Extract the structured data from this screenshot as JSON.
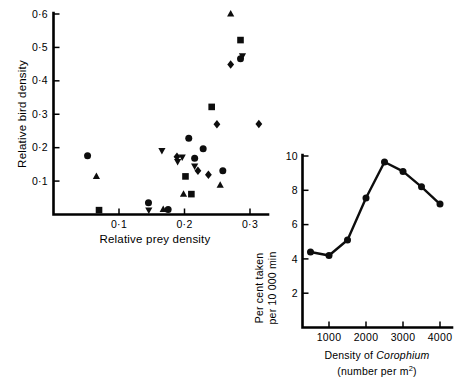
{
  "figure": {
    "name": "relative-bird-density-vs-relative-prey-density"
  },
  "chart_data": [
    {
      "id": "main",
      "type": "scatter",
      "title": "",
      "xlabel": "Relative prey density",
      "ylabel": "Relative bird density",
      "xlim": [
        0.0,
        0.345
      ],
      "ylim": [
        0.0,
        0.615
      ],
      "xticks": [
        0.1,
        0.2,
        0.3
      ],
      "xticklabels": [
        "0·1",
        "0·2",
        "0·3"
      ],
      "yticks": [
        0.1,
        0.2,
        0.3,
        0.4,
        0.5,
        0.6
      ],
      "yticklabels": [
        "0·1",
        "0·2",
        "0·3",
        "0·4",
        "0·5",
        "0·6"
      ],
      "grid": false,
      "legend": "none",
      "series": [
        {
          "name": "circle",
          "marker": "circle",
          "points": [
            [
              0.052,
              0.176
            ],
            [
              0.145,
              0.035
            ],
            [
              0.175,
              0.015
            ],
            [
              0.2065,
              0.228
            ],
            [
              0.2155,
              0.168
            ],
            [
              0.2285,
              0.197
            ],
            [
              0.2585,
              0.131
            ],
            [
              0.2855,
              0.466
            ]
          ]
        },
        {
          "name": "square",
          "marker": "square",
          "points": [
            [
              0.0695,
              0.013
            ],
            [
              0.2015,
              0.114
            ],
            [
              0.2105,
              0.061
            ],
            [
              0.2415,
              0.322
            ],
            [
              0.2855,
              0.522
            ]
          ]
        },
        {
          "name": "triangle-up",
          "marker": "triangle-up",
          "points": [
            [
              0.0655,
              0.114
            ],
            [
              0.1675,
              0.0155
            ],
            [
              0.1985,
              0.061
            ],
            [
              0.2545,
              0.088
            ],
            [
              0.2705,
              0.6
            ]
          ]
        },
        {
          "name": "triangle-down",
          "marker": "triangle-down",
          "points": [
            [
              0.1455,
              0.013
            ],
            [
              0.1655,
              0.191
            ],
            [
              0.1895,
              0.158
            ],
            [
              0.1965,
              0.172
            ],
            [
              0.2155,
              0.145
            ],
            [
              0.2885,
              0.475
            ]
          ]
        },
        {
          "name": "diamond",
          "marker": "diamond",
          "points": [
            [
              0.1885,
              0.173
            ],
            [
              0.2205,
              0.131
            ],
            [
              0.2365,
              0.119
            ],
            [
              0.2495,
              0.27
            ],
            [
              0.2705,
              0.449
            ],
            [
              0.3135,
              0.271
            ]
          ]
        }
      ]
    },
    {
      "id": "inset",
      "type": "line",
      "title": "",
      "xlabel_line1_prefix": "Density of ",
      "xlabel_line1_italic": "Corophium",
      "xlabel_line2": "(number per m",
      "xlabel_line2_sup": "2",
      "xlabel_line2_suffix": ")",
      "ylabel_line1": "Per cent taken",
      "ylabel_line2": "per 10 000 min",
      "xlim": [
        0,
        4450
      ],
      "ylim": [
        0,
        10.6
      ],
      "xticks": [
        1000,
        2000,
        3000,
        4000
      ],
      "xticklabels": [
        "1000",
        "2000",
        "3000",
        "4000"
      ],
      "yticks": [
        2,
        4,
        6,
        8,
        10
      ],
      "yticklabels": [
        "2",
        "4",
        "6",
        "8",
        "10"
      ],
      "grid": false,
      "legend": "none",
      "marker": "circle",
      "x": [
        500,
        1000,
        1500,
        2000,
        2500,
        3000,
        3500,
        4000
      ],
      "y": [
        4.4,
        4.2,
        5.1,
        7.55,
        9.65,
        9.1,
        8.2,
        7.2
      ]
    }
  ],
  "colors": {
    "ink": "#0d0d0d",
    "background": "#ffffff"
  }
}
